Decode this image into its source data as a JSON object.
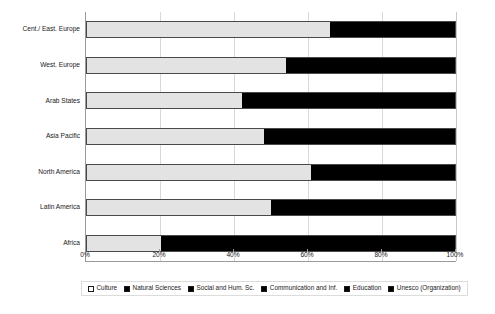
{
  "chart_data": {
    "type": "bar",
    "orientation": "horizontal",
    "stacked": true,
    "normalized": "100%",
    "title": "",
    "xlabel": "",
    "ylabel": "",
    "xlim": [
      0,
      100
    ],
    "xticks": [
      "0%",
      "20%",
      "40%",
      "60%",
      "80%",
      "100%"
    ],
    "xtick_values": [
      0,
      20,
      40,
      60,
      80,
      100
    ],
    "grid": true,
    "legend_position": "bottom",
    "categories": [
      "Cent./ East. Europe",
      "West. Europe",
      "Arab States",
      "Asia Pacific",
      "North America",
      "Latin America",
      "Africa"
    ],
    "series": [
      {
        "name": "Culture",
        "color": "#e3e3e3",
        "values": [
          66,
          54,
          42,
          48,
          61,
          50,
          20
        ]
      },
      {
        "name": "Natural Sciences",
        "color": "#000000",
        "values": [
          7,
          9,
          12,
          10,
          8,
          10,
          16
        ]
      },
      {
        "name": "Social and Hum. Sc.",
        "color": "#000000",
        "values": [
          6,
          9,
          11,
          10,
          8,
          10,
          16
        ]
      },
      {
        "name": "Communication and Inf.",
        "color": "#000000",
        "values": [
          7,
          9,
          12,
          11,
          8,
          10,
          16
        ]
      },
      {
        "name": "Education",
        "color": "#000000",
        "values": [
          7,
          10,
          12,
          11,
          8,
          10,
          16
        ]
      },
      {
        "name": "Unesco (Organization)",
        "color": "#000000",
        "values": [
          7,
          9,
          11,
          10,
          7,
          10,
          16
        ]
      }
    ]
  },
  "legend": {
    "items": [
      {
        "label": "Culture",
        "color": "#ffffff"
      },
      {
        "label": "Natural Sciences",
        "color": "#000000"
      },
      {
        "label": "Social and Hum. Sc.",
        "color": "#000000"
      },
      {
        "label": "Communication and Inf.",
        "color": "#000000"
      },
      {
        "label": "Education",
        "color": "#000000"
      },
      {
        "label": "Unesco (Organization)",
        "color": "#000000"
      }
    ]
  },
  "colors": {
    "culture_fill": "#e3e3e3",
    "other_fill": "#000000",
    "bar_border": "#4a4a4a",
    "axis": "#9a9a9a",
    "gridline": "#d8d8d8",
    "text": "#1a1a1a",
    "background": "#ffffff"
  }
}
